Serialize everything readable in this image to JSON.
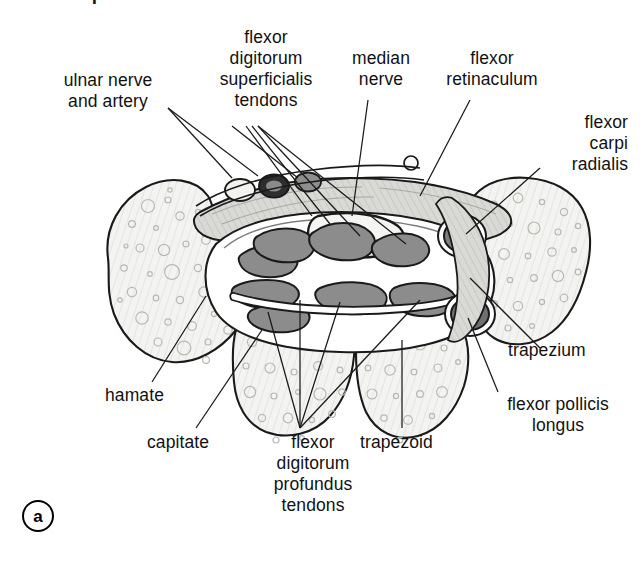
{
  "figure": {
    "marker": "a",
    "cropped_heading": "Carpal tunnel",
    "caption_note": ""
  },
  "labels": [
    {
      "id": "ulnar-nerve-and-artery",
      "text": "ulnar nerve\nand artery",
      "align": "center",
      "x": 28,
      "y": 70,
      "width": 160
    },
    {
      "id": "flexor-digitorum-superficialis-tendons",
      "text": "flexor\ndigitorum\nsuperficialis\ntendons",
      "align": "center",
      "x": 196,
      "y": 27,
      "width": 140
    },
    {
      "id": "median-nerve",
      "text": "median\nnerve",
      "align": "center",
      "x": 336,
      "y": 48,
      "width": 90
    },
    {
      "id": "flexor-retinaculum",
      "text": "flexor\nretinaculum",
      "align": "center",
      "x": 432,
      "y": 48,
      "width": 120
    },
    {
      "id": "flexor-carpi-radialis",
      "text": "flexor\ncarpi\nradialis",
      "align": "right",
      "x": 500,
      "y": 112,
      "width": 128
    },
    {
      "id": "trapezium",
      "text": "trapezium",
      "align": "left",
      "x": 508,
      "y": 340,
      "width": 130
    },
    {
      "id": "flexor-pollicis-longus",
      "text": "flexor pollicis\nlongus",
      "align": "center",
      "x": 478,
      "y": 394,
      "width": 160
    },
    {
      "id": "hamate",
      "text": "hamate",
      "align": "left",
      "x": 105,
      "y": 385,
      "width": 100
    },
    {
      "id": "capitate",
      "text": "capitate",
      "align": "left",
      "x": 147,
      "y": 432,
      "width": 100
    },
    {
      "id": "flexor-digitorum-profundus-tendons",
      "text": "flexor\ndigitorum\nprofundus\ntendons",
      "align": "center",
      "x": 258,
      "y": 432,
      "width": 110
    },
    {
      "id": "trapezoid",
      "text": "trapezoid",
      "align": "left",
      "x": 360,
      "y": 432,
      "width": 110
    }
  ],
  "anatomy": {
    "view": "axial cross-section of the carpal tunnel at the distal carpal row",
    "bones": [
      {
        "name": "hamate",
        "side": "ulnar"
      },
      {
        "name": "capitate",
        "side": "central"
      },
      {
        "name": "trapezoid",
        "side": "central-radial"
      },
      {
        "name": "trapezium",
        "side": "radial"
      }
    ],
    "tunnel_contents": [
      "flexor digitorum superficialis tendons",
      "flexor digitorum profundus tendons",
      "median nerve",
      "flexor pollicis longus"
    ],
    "outside_tunnel": [
      "ulnar nerve",
      "ulnar artery",
      "flexor carpi radialis"
    ],
    "roof": "flexor retinaculum"
  },
  "colors": {
    "outline": "#1a1a1a",
    "bone_fill": "#f2f2f0",
    "bone_hatch": "#cfcfcb",
    "tendon_fill": "#8c8c8c",
    "tendon_dark": "#6f6f6f",
    "sheath_fill": "#c9c9c6",
    "retinaculum_fill": "#d4d4d0",
    "nerve_light": "#f4f4f2",
    "ulnar_nerve_fill": "#3a3a3a",
    "background": "#ffffff"
  }
}
